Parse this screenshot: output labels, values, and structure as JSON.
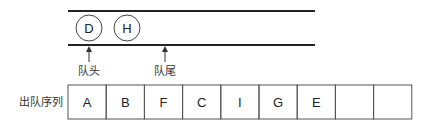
{
  "queue": {
    "elements": [
      "D",
      "H"
    ],
    "head_label": "队头",
    "tail_label": "队尾"
  },
  "dequeue_sequence": {
    "label": "出队序列",
    "cells": [
      "A",
      "B",
      "F",
      "C",
      "I",
      "G",
      "E",
      "",
      ""
    ]
  },
  "colors": {
    "line": "#222222",
    "cell_border": "#555555"
  }
}
